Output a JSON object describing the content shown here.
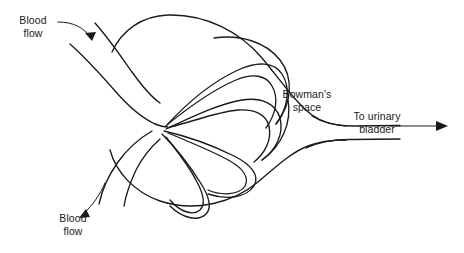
{
  "figure": {
    "type": "anatomical-line-diagram",
    "background_color": "#ffffff",
    "stroke_color": "#1a1a1a",
    "width": 464,
    "height": 253
  },
  "labels": {
    "blood_flow_in": "Blood\nflow",
    "blood_flow_out": "Blood\nflow",
    "bowmans_space": "Bowman's\nspace",
    "to_urinary_bladder": "To urinary\nbladder"
  },
  "annotations": {
    "leader_in_arrow": "arrow-pointing-down-right",
    "leader_out_arrow": "arrow-pointing-down-left",
    "tubule_arrow": "arrow-pointing-right"
  },
  "structures": [
    "afferent-arteriole",
    "efferent-arteriole",
    "glomerular-capillary-loops",
    "bowmans-capsule-outline",
    "proximal-tubule-outlet"
  ]
}
